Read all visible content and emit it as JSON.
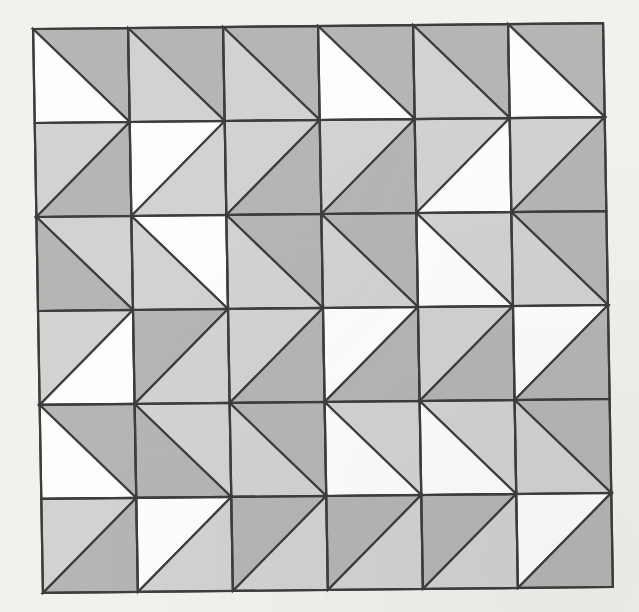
{
  "artwork": {
    "title": "Triangle Tiling Quilt Pattern",
    "medium": "geometric line drawing on paper",
    "background_color": "#f2f1ee",
    "stroke_color": "#3d3d3d",
    "stroke_width": 2.2,
    "palette": {
      "white": "#fdfdfb",
      "light_gray": "#d2d2d0",
      "dark_gray": "#b5b5b3"
    },
    "grid": {
      "rows": 6,
      "cols": 6,
      "cell_width": 95,
      "cell_height": 94,
      "origin_x": 38,
      "origin_y": 26,
      "rotation_deg": -0.6,
      "skew_deg": 0.4
    },
    "cells": [
      [
        {
          "diagonal": "anti",
          "a": "dark_gray",
          "b": "white"
        },
        {
          "diagonal": "anti",
          "a": "dark_gray",
          "b": "light_gray"
        },
        {
          "diagonal": "anti",
          "a": "dark_gray",
          "b": "light_gray"
        },
        {
          "diagonal": "anti",
          "a": "dark_gray",
          "b": "white"
        },
        {
          "diagonal": "anti",
          "a": "dark_gray",
          "b": "light_gray"
        },
        {
          "diagonal": "anti",
          "a": "dark_gray",
          "b": "white"
        }
      ],
      [
        {
          "diagonal": "main",
          "a": "light_gray",
          "b": "dark_gray"
        },
        {
          "diagonal": "main",
          "a": "white",
          "b": "light_gray"
        },
        {
          "diagonal": "main",
          "a": "light_gray",
          "b": "dark_gray"
        },
        {
          "diagonal": "main",
          "a": "light_gray",
          "b": "dark_gray"
        },
        {
          "diagonal": "main",
          "a": "light_gray",
          "b": "white"
        },
        {
          "diagonal": "main",
          "a": "light_gray",
          "b": "dark_gray"
        }
      ],
      [
        {
          "diagonal": "anti",
          "a": "light_gray",
          "b": "dark_gray"
        },
        {
          "diagonal": "anti",
          "a": "white",
          "b": "light_gray"
        },
        {
          "diagonal": "anti",
          "a": "dark_gray",
          "b": "light_gray"
        },
        {
          "diagonal": "anti",
          "a": "dark_gray",
          "b": "light_gray"
        },
        {
          "diagonal": "anti",
          "a": "light_gray",
          "b": "white"
        },
        {
          "diagonal": "anti",
          "a": "dark_gray",
          "b": "light_gray"
        }
      ],
      [
        {
          "diagonal": "main",
          "a": "light_gray",
          "b": "white"
        },
        {
          "diagonal": "main",
          "a": "dark_gray",
          "b": "light_gray"
        },
        {
          "diagonal": "main",
          "a": "light_gray",
          "b": "dark_gray"
        },
        {
          "diagonal": "main",
          "a": "white",
          "b": "dark_gray"
        },
        {
          "diagonal": "main",
          "a": "light_gray",
          "b": "dark_gray"
        },
        {
          "diagonal": "main",
          "a": "white",
          "b": "dark_gray"
        }
      ],
      [
        {
          "diagonal": "anti",
          "a": "dark_gray",
          "b": "white"
        },
        {
          "diagonal": "anti",
          "a": "light_gray",
          "b": "dark_gray"
        },
        {
          "diagonal": "anti",
          "a": "dark_gray",
          "b": "light_gray"
        },
        {
          "diagonal": "anti",
          "a": "light_gray",
          "b": "white"
        },
        {
          "diagonal": "anti",
          "a": "light_gray",
          "b": "white"
        },
        {
          "diagonal": "anti",
          "a": "dark_gray",
          "b": "light_gray"
        }
      ],
      [
        {
          "diagonal": "main",
          "a": "light_gray",
          "b": "dark_gray"
        },
        {
          "diagonal": "main",
          "a": "white",
          "b": "light_gray"
        },
        {
          "diagonal": "main",
          "a": "dark_gray",
          "b": "light_gray"
        },
        {
          "diagonal": "main",
          "a": "dark_gray",
          "b": "light_gray"
        },
        {
          "diagonal": "main",
          "a": "dark_gray",
          "b": "light_gray"
        },
        {
          "diagonal": "main",
          "a": "white",
          "b": "dark_gray"
        }
      ]
    ]
  }
}
